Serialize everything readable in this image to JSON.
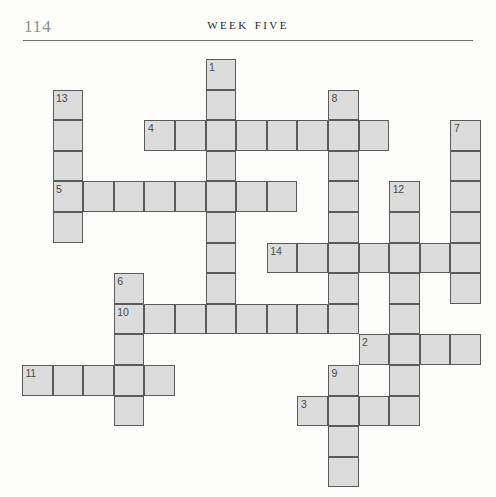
{
  "page": {
    "folio": "114",
    "running_head": "Week Five",
    "background_color": "#fdfdfc"
  },
  "grid": {
    "cell_size": 30.6,
    "origin_x": 22,
    "origin_y": 59,
    "fill_color": "#dcdcdc",
    "border_color": "#5b5b5b",
    "number_color": "#4a4a4a",
    "cells": [
      {
        "col": 6,
        "row": 0,
        "number": "1"
      },
      {
        "col": 6,
        "row": 1,
        "number": ""
      },
      {
        "col": 1,
        "row": 1,
        "number": "13"
      },
      {
        "col": 1,
        "row": 2,
        "number": ""
      },
      {
        "col": 1,
        "row": 3,
        "number": ""
      },
      {
        "col": 10,
        "row": 1,
        "number": "8"
      },
      {
        "col": 4,
        "row": 2,
        "number": "4"
      },
      {
        "col": 5,
        "row": 2,
        "number": ""
      },
      {
        "col": 6,
        "row": 2,
        "number": ""
      },
      {
        "col": 7,
        "row": 2,
        "number": ""
      },
      {
        "col": 8,
        "row": 2,
        "number": ""
      },
      {
        "col": 9,
        "row": 2,
        "number": ""
      },
      {
        "col": 10,
        "row": 2,
        "number": ""
      },
      {
        "col": 11,
        "row": 2,
        "number": ""
      },
      {
        "col": 14,
        "row": 2,
        "number": "7"
      },
      {
        "col": 14,
        "row": 3,
        "number": ""
      },
      {
        "col": 14,
        "row": 4,
        "number": ""
      },
      {
        "col": 14,
        "row": 5,
        "number": ""
      },
      {
        "col": 14,
        "row": 6,
        "number": ""
      },
      {
        "col": 14,
        "row": 7,
        "number": ""
      },
      {
        "col": 6,
        "row": 3,
        "number": ""
      },
      {
        "col": 10,
        "row": 3,
        "number": ""
      },
      {
        "col": 1,
        "row": 4,
        "number": "5"
      },
      {
        "col": 2,
        "row": 4,
        "number": ""
      },
      {
        "col": 3,
        "row": 4,
        "number": ""
      },
      {
        "col": 4,
        "row": 4,
        "number": ""
      },
      {
        "col": 5,
        "row": 4,
        "number": ""
      },
      {
        "col": 6,
        "row": 4,
        "number": ""
      },
      {
        "col": 7,
        "row": 4,
        "number": ""
      },
      {
        "col": 8,
        "row": 4,
        "number": ""
      },
      {
        "col": 10,
        "row": 4,
        "number": ""
      },
      {
        "col": 12,
        "row": 4,
        "number": "12"
      },
      {
        "col": 1,
        "row": 5,
        "number": ""
      },
      {
        "col": 6,
        "row": 5,
        "number": ""
      },
      {
        "col": 10,
        "row": 5,
        "number": ""
      },
      {
        "col": 12,
        "row": 5,
        "number": ""
      },
      {
        "col": 6,
        "row": 6,
        "number": ""
      },
      {
        "col": 8,
        "row": 6,
        "number": "14"
      },
      {
        "col": 9,
        "row": 6,
        "number": ""
      },
      {
        "col": 10,
        "row": 6,
        "number": ""
      },
      {
        "col": 11,
        "row": 6,
        "number": ""
      },
      {
        "col": 12,
        "row": 6,
        "number": ""
      },
      {
        "col": 13,
        "row": 6,
        "number": ""
      },
      {
        "col": 3,
        "row": 7,
        "number": "6"
      },
      {
        "col": 6,
        "row": 7,
        "number": ""
      },
      {
        "col": 10,
        "row": 7,
        "number": ""
      },
      {
        "col": 12,
        "row": 7,
        "number": ""
      },
      {
        "col": 3,
        "row": 8,
        "number": "10"
      },
      {
        "col": 4,
        "row": 8,
        "number": ""
      },
      {
        "col": 5,
        "row": 8,
        "number": ""
      },
      {
        "col": 6,
        "row": 8,
        "number": ""
      },
      {
        "col": 7,
        "row": 8,
        "number": ""
      },
      {
        "col": 8,
        "row": 8,
        "number": ""
      },
      {
        "col": 9,
        "row": 8,
        "number": ""
      },
      {
        "col": 10,
        "row": 8,
        "number": ""
      },
      {
        "col": 12,
        "row": 8,
        "number": ""
      },
      {
        "col": 3,
        "row": 9,
        "number": ""
      },
      {
        "col": 11,
        "row": 9,
        "number": "2"
      },
      {
        "col": 12,
        "row": 9,
        "number": ""
      },
      {
        "col": 13,
        "row": 9,
        "number": ""
      },
      {
        "col": 14,
        "row": 9,
        "number": ""
      },
      {
        "col": 0,
        "row": 10,
        "number": "11"
      },
      {
        "col": 1,
        "row": 10,
        "number": ""
      },
      {
        "col": 2,
        "row": 10,
        "number": ""
      },
      {
        "col": 3,
        "row": 10,
        "number": ""
      },
      {
        "col": 4,
        "row": 10,
        "number": ""
      },
      {
        "col": 10,
        "row": 10,
        "number": "9"
      },
      {
        "col": 12,
        "row": 10,
        "number": ""
      },
      {
        "col": 3,
        "row": 11,
        "number": ""
      },
      {
        "col": 9,
        "row": 11,
        "number": "3"
      },
      {
        "col": 10,
        "row": 11,
        "number": ""
      },
      {
        "col": 11,
        "row": 11,
        "number": ""
      },
      {
        "col": 12,
        "row": 11,
        "number": ""
      },
      {
        "col": 10,
        "row": 12,
        "number": ""
      },
      {
        "col": 10,
        "row": 13,
        "number": ""
      }
    ]
  }
}
